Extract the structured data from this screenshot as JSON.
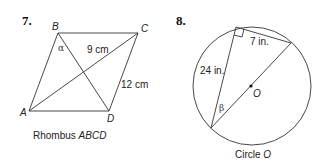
{
  "problems": [
    {
      "number": "7.",
      "vertices": {
        "A": "A",
        "B": "B",
        "C": "C",
        "D": "D"
      },
      "angle_label": "α",
      "diagonal_label": "9 cm",
      "side_label": "12 cm",
      "caption_prefix": "Rhombus ",
      "caption_name": "ABCD"
    },
    {
      "number": "8.",
      "leg_short_label": "7 in.",
      "leg_long_label": "24 in.",
      "angle_label": "β",
      "center_label": "O",
      "caption_prefix": "Circle ",
      "caption_name": "O"
    }
  ]
}
